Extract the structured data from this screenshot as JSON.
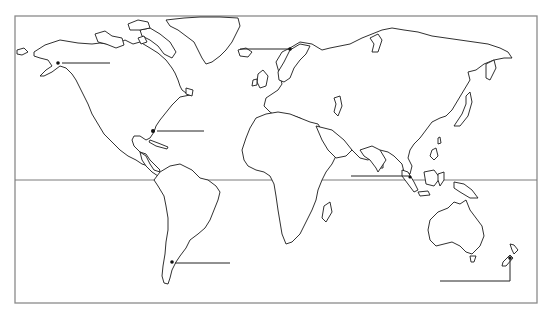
{
  "map": {
    "type": "blank outline world map",
    "colors": {
      "land_stroke": "#1a1a1a",
      "frame": "#8a8a8a",
      "background": "#ffffff"
    },
    "reference_lines": [
      {
        "name": "equator",
        "y": 180
      }
    ],
    "label_blanks": [
      {
        "id": "alaska",
        "marker": [
          58,
          63
        ],
        "line": [
          [
            62,
            63
          ],
          [
            110,
            63
          ]
        ],
        "text": ""
      },
      {
        "id": "norway",
        "marker": [
          290,
          49
        ],
        "line": [
          [
            240,
            49
          ],
          [
            290,
            49
          ]
        ],
        "text": ""
      },
      {
        "id": "florida",
        "marker": [
          153,
          131
        ],
        "line": [
          [
            157,
            131
          ],
          [
            204,
            131
          ]
        ],
        "text": ""
      },
      {
        "id": "indonesia",
        "marker": [
          410,
          178
        ],
        "line": [
          [
            351,
            176
          ],
          [
            410,
            176
          ]
        ],
        "text": ""
      },
      {
        "id": "argentina",
        "marker": [
          172,
          262
        ],
        "line": [
          [
            175,
            263
          ],
          [
            230,
            263
          ]
        ],
        "text": ""
      },
      {
        "id": "new-zealand",
        "marker": [
          510,
          258
        ],
        "line": [
          [
            510,
            258
          ],
          [
            510,
            281
          ],
          [
            440,
            281
          ]
        ],
        "text": ""
      }
    ]
  }
}
